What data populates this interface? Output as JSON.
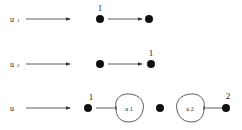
{
  "rows": [
    {
      "label": "u",
      "sub": "1",
      "top_label": "1"
    },
    {
      "label": "u",
      "sub": "2",
      "top_label": "1"
    },
    {
      "label": "u",
      "sub": "",
      "left_label": "1",
      "right_label": "2",
      "blob1": "u 1",
      "blob2": "u 2"
    }
  ],
  "colors": {
    "ink": "#111111",
    "background": "#ffffff"
  }
}
